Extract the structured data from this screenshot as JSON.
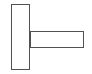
{
  "canvas": {
    "width": 92,
    "height": 74,
    "background_color": "#ffffff",
    "title": "Tee shape line drawing"
  },
  "style": {
    "stroke_color": "#515151",
    "stroke_width": 1,
    "fill_color": "#ffffff"
  },
  "shapes": [
    {
      "name": "vertical-bar",
      "label": "Vertical bar",
      "type": "rectangle",
      "x": 11,
      "y": 4,
      "width": 19,
      "height": 66
    },
    {
      "name": "horizontal-bar",
      "label": "Horizontal bar",
      "type": "rectangle",
      "x": 30,
      "y": 31,
      "width": 54,
      "height": 17
    }
  ]
}
